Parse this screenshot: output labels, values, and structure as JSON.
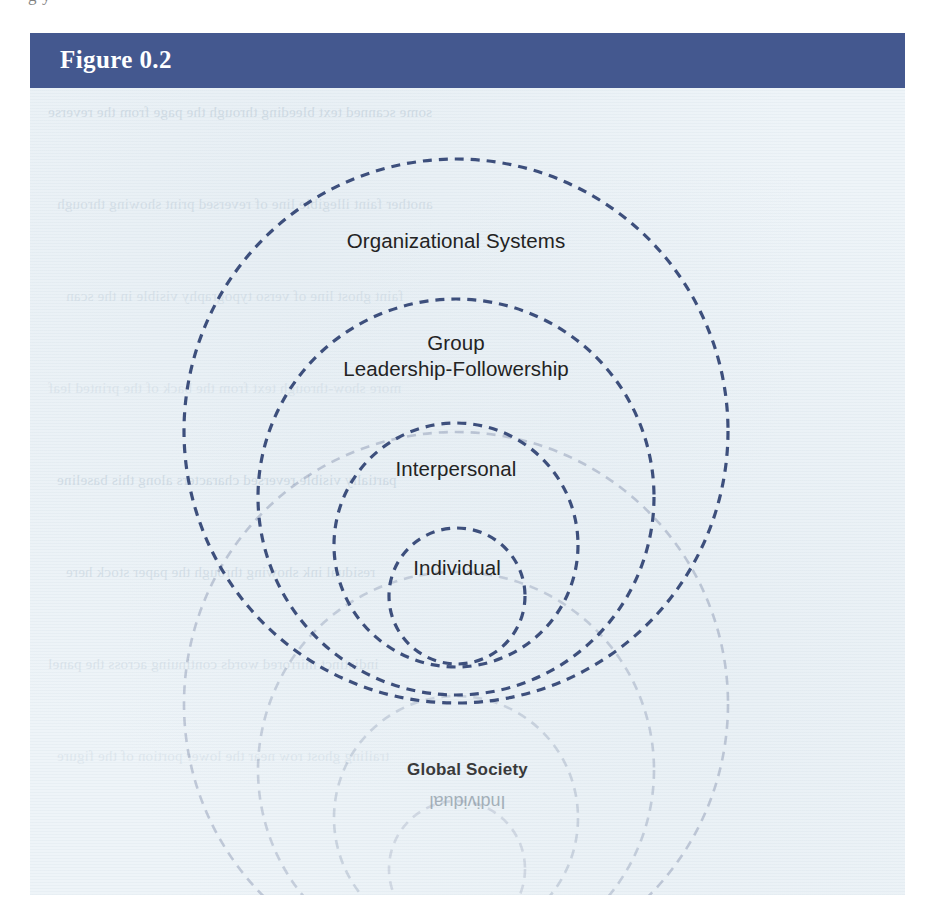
{
  "page": {
    "background_color": "#ffffff",
    "top_bleed_text": "g         y"
  },
  "figure": {
    "header": {
      "title": "Figure 0.2",
      "background_color": "#44588f",
      "text_color": "#ffffff"
    },
    "body": {
      "background_color": "#eef4f8"
    },
    "diagram": {
      "type": "concentric-dashed-circles",
      "stroke_color": "#3d4f7c",
      "label_color": "#232323",
      "rings": [
        {
          "id": "organizational-systems",
          "label": "Organizational Systems",
          "label_lines": [
            "Organizational Systems"
          ],
          "cx": 426,
          "cy": 343,
          "r": 272,
          "label_y": 140
        },
        {
          "id": "group-leadership-followership",
          "label": "Group Leadership-Followership",
          "label_lines": [
            "Group",
            "Leadership-Followership"
          ],
          "cx": 426,
          "cy": 409,
          "r": 198,
          "label_y": 242
        },
        {
          "id": "interpersonal",
          "label": "Interpersonal",
          "label_lines": [
            "Interpersonal"
          ],
          "cx": 426,
          "cy": 457,
          "r": 122,
          "label_y": 368
        },
        {
          "id": "individual",
          "label": "Individual",
          "label_lines": [
            "Individual"
          ],
          "cx": 427,
          "cy": 508,
          "r": 68,
          "label_y": 467
        }
      ]
    },
    "bleed_through": {
      "global_society_label": "Global Society",
      "individual_mirrored_label": "Individual",
      "ghost_rings": [
        {
          "cx": 426,
          "cy": 616,
          "r": 272
        },
        {
          "cx": 426,
          "cy": 682,
          "r": 198
        },
        {
          "cx": 426,
          "cy": 730,
          "r": 122
        },
        {
          "cx": 427,
          "cy": 781,
          "r": 68
        }
      ],
      "paper_rows": [
        "some scanned text bleeding through the page from the reverse",
        "another faint illegible line of reversed print showing through",
        "faint ghost line of verso typography visible in the scan",
        "more show-through text from the back of the printed leaf",
        "partially visible reversed characters along this baseline",
        "residual ink showing through the paper stock here",
        "indistinct mirrored words continuing across the panel",
        "trailing ghost row near the lower portion of the figure"
      ]
    }
  }
}
